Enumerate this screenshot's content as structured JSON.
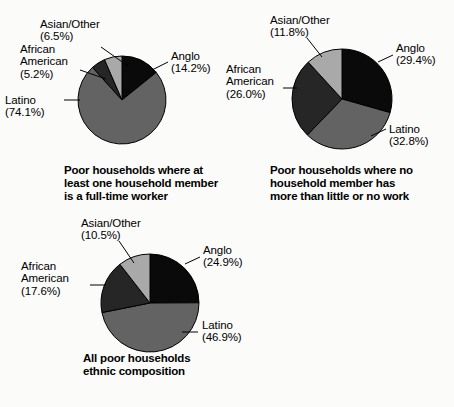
{
  "figure": {
    "background_color": "#fbfbfa",
    "text_color": "#000000"
  },
  "palette": {
    "Anglo": "#0a0a0a",
    "Latino": "#636363",
    "African American": "#262626",
    "Asian/Other": "#a9a9a9",
    "outline": "#000000"
  },
  "charts": [
    {
      "id": "chart-fulltime-worker",
      "caption_lines": [
        "Poor households where at",
        "least one household member",
        "is a full-time worker"
      ],
      "labels": {
        "anglo": {
          "name": "Anglo",
          "pct": "(14.2%)"
        },
        "latino": {
          "name": "Latino",
          "pct": "(74.1%)"
        },
        "african_american_line1": "African",
        "african_american_line2": "American",
        "african_american_pct": "(5.2%)",
        "asian_other": {
          "name": "Asian/Other",
          "pct": "(6.5%)"
        }
      }
    },
    {
      "id": "chart-no-work",
      "caption_lines": [
        "Poor households where no",
        "household member has",
        "more than little or no work"
      ],
      "labels": {
        "anglo": {
          "name": "Anglo",
          "pct": "(29.4%)"
        },
        "latino": {
          "name": "Latino",
          "pct": "(32.8%)"
        },
        "african_american_line1": "African",
        "african_american_line2": "American",
        "african_american_pct": "(26.0%)",
        "asian_other": {
          "name": "Asian/Other",
          "pct": "(11.8%)"
        }
      }
    },
    {
      "id": "chart-all-poor",
      "caption_lines": [
        "All poor households",
        "ethnic composition"
      ],
      "labels": {
        "anglo": {
          "name": "Anglo",
          "pct": "(24.9%)"
        },
        "latino": {
          "name": "Latino",
          "pct": "(46.9%)"
        },
        "african_american_line1": "African",
        "african_american_line2": "American",
        "african_american_pct": "(17.6%)",
        "asian_other": {
          "name": "Asian/Other",
          "pct": "(10.5%)"
        }
      }
    }
  ],
  "chart_data": [
    {
      "type": "pie",
      "title": "Poor households where at least one household member is a full-time worker",
      "categories": [
        "Anglo",
        "Latino",
        "African American",
        "Asian/Other"
      ],
      "values": [
        14.2,
        74.1,
        5.2,
        6.5
      ],
      "value_labels": [
        "(14.2%)",
        "(74.1%)",
        "(5.2%)",
        "(6.5%)"
      ],
      "unit": "percent",
      "start_angle_deg": 0,
      "direction": "clockwise",
      "colors": [
        "#0a0a0a",
        "#636363",
        "#262626",
        "#a9a9a9"
      ],
      "legend": "labels-outside-with-leader-lines",
      "grid": false
    },
    {
      "type": "pie",
      "title": "Poor households where no household member has more than little or no work",
      "categories": [
        "Anglo",
        "Latino",
        "African American",
        "Asian/Other"
      ],
      "values": [
        29.4,
        32.8,
        26.0,
        11.8
      ],
      "value_labels": [
        "(29.4%)",
        "(32.8%)",
        "(26.0%)",
        "(11.8%)"
      ],
      "unit": "percent",
      "start_angle_deg": 0,
      "direction": "clockwise",
      "colors": [
        "#0a0a0a",
        "#636363",
        "#262626",
        "#a9a9a9"
      ],
      "legend": "labels-outside-with-leader-lines",
      "grid": false
    },
    {
      "type": "pie",
      "title": "All poor households ethnic composition",
      "categories": [
        "Anglo",
        "Latino",
        "African American",
        "Asian/Other"
      ],
      "values": [
        24.9,
        46.9,
        17.6,
        10.5
      ],
      "value_labels": [
        "(24.9%)",
        "(46.9%)",
        "(17.6%)",
        "(10.5%)"
      ],
      "unit": "percent",
      "start_angle_deg": 0,
      "direction": "clockwise",
      "colors": [
        "#0a0a0a",
        "#636363",
        "#262626",
        "#a9a9a9"
      ],
      "legend": "labels-outside-with-leader-lines",
      "grid": false
    }
  ]
}
